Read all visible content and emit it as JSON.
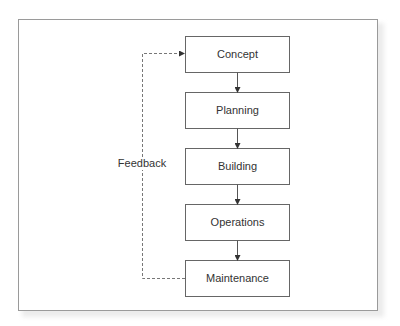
{
  "diagram": {
    "type": "flowchart",
    "stages": [
      {
        "label": "Concept"
      },
      {
        "label": "Planning"
      },
      {
        "label": "Building"
      },
      {
        "label": "Operations"
      },
      {
        "label": "Maintenance"
      }
    ],
    "flow_edges": [
      {
        "from": "Concept",
        "to": "Planning"
      },
      {
        "from": "Planning",
        "to": "Building"
      },
      {
        "from": "Building",
        "to": "Operations"
      },
      {
        "from": "Operations",
        "to": "Maintenance"
      }
    ],
    "feedback": {
      "label": "Feedback",
      "from": "Maintenance",
      "to": "Concept",
      "style": "dashed"
    },
    "colors": {
      "box_border": "#666666",
      "text": "#333333",
      "frame_border": "#9a9a9a"
    }
  }
}
